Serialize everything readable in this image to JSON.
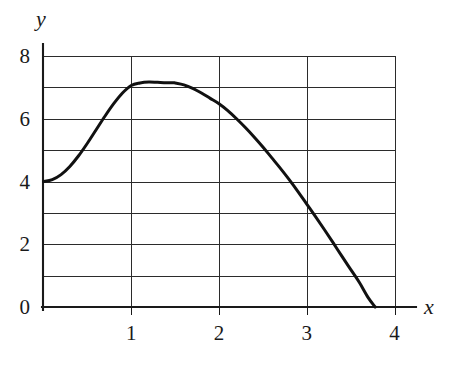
{
  "chart_data": {
    "type": "line",
    "title": "",
    "subtitle": "",
    "xlabel": "x",
    "ylabel": "y",
    "xlim": [
      0,
      4
    ],
    "ylim": [
      0,
      8
    ],
    "grid": true,
    "legend": null,
    "x_ticks": [
      {
        "value": 1,
        "label": "1"
      },
      {
        "value": 2,
        "label": "2"
      },
      {
        "value": 3,
        "label": "3"
      },
      {
        "value": 4,
        "label": "4"
      }
    ],
    "y_ticks": [
      {
        "value": 0,
        "label": "0"
      },
      {
        "value": 2,
        "label": "2"
      },
      {
        "value": 4,
        "label": "4"
      },
      {
        "value": 6,
        "label": "6"
      },
      {
        "value": 8,
        "label": "8"
      }
    ],
    "x_gridlines": [
      0,
      1,
      2,
      3,
      4
    ],
    "y_gridlines": [
      0,
      1,
      2,
      3,
      4,
      5,
      6,
      7,
      8
    ],
    "annotations": [],
    "series": [
      {
        "name": "curve",
        "color": "#111111",
        "x": [
          0.0,
          0.1,
          0.2,
          0.3,
          0.4,
          0.5,
          0.6,
          0.7,
          0.8,
          0.9,
          1.0,
          1.1,
          1.2,
          1.3,
          1.4,
          1.47,
          1.5,
          1.6,
          1.7,
          1.8,
          1.9,
          2.0,
          2.1,
          2.2,
          2.3,
          2.4,
          2.5,
          2.6,
          2.7,
          2.8,
          2.9,
          3.0,
          3.1,
          3.2,
          3.3,
          3.4,
          3.5,
          3.6,
          3.7,
          3.78
        ],
        "y": [
          4.0,
          4.06,
          4.22,
          4.48,
          4.82,
          5.22,
          5.65,
          6.08,
          6.48,
          6.82,
          7.06,
          7.14,
          7.17,
          7.16,
          7.15,
          7.15,
          7.14,
          7.08,
          6.97,
          6.82,
          6.65,
          6.48,
          6.26,
          6.0,
          5.72,
          5.42,
          5.1,
          4.76,
          4.42,
          4.06,
          3.68,
          3.28,
          2.88,
          2.47,
          2.05,
          1.62,
          1.2,
          0.78,
          0.3,
          0.0
        ]
      }
    ],
    "key_points": {
      "start": {
        "x": 0,
        "y": 4
      },
      "maximum": {
        "x": 1.47,
        "y": 7.16
      },
      "x_intercept": {
        "x": 3.78,
        "y": 0
      }
    }
  },
  "axes": {
    "y_axis_label": "y",
    "x_axis_label": "x"
  }
}
